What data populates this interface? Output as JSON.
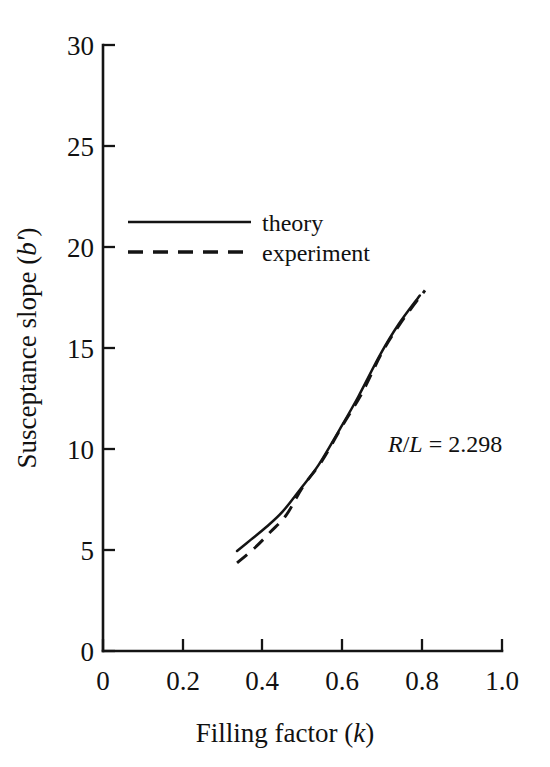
{
  "chart_data": {
    "type": "line",
    "title": "",
    "xlabel": "Filling factor  (k)",
    "xlabel_main": "Filling factor",
    "xlabel_symbol": "k",
    "ylabel": "Susceptance slope (b')",
    "ylabel_main": "Susceptance slope",
    "ylabel_symbol": "b'",
    "xlim": [
      0,
      1.0
    ],
    "ylim": [
      0,
      30
    ],
    "xticks": [
      0,
      0.2,
      0.4,
      0.6,
      0.8,
      1.0
    ],
    "xtick_labels": [
      "0",
      "0.2",
      "0.4",
      "0.6",
      "0.8",
      "1.0"
    ],
    "yticks": [
      0,
      5,
      10,
      15,
      20,
      25,
      30
    ],
    "ytick_labels": [
      "0",
      "5",
      "10",
      "15",
      "20",
      "25",
      "30"
    ],
    "grid": false,
    "legend_position": "upper-left-inside",
    "series": [
      {
        "name": "theory",
        "style": "solid",
        "color": "#141414",
        "x": [
          0.336,
          0.37,
          0.41,
          0.45,
          0.494,
          0.54,
          0.594,
          0.64,
          0.694,
          0.74,
          0.794
        ],
        "y": [
          4.95,
          5.5,
          6.15,
          6.9,
          8.0,
          9.2,
          11.0,
          12.6,
          14.65,
          16.15,
          17.6
        ]
      },
      {
        "name": "experiment",
        "style": "dashed",
        "color": "#141414",
        "x": [
          0.336,
          0.38,
          0.42,
          0.46,
          0.5,
          0.55,
          0.6,
          0.65,
          0.7,
          0.75,
          0.807
        ],
        "y": [
          4.36,
          5.1,
          5.9,
          6.75,
          8.1,
          9.45,
          11.15,
          12.8,
          14.8,
          16.35,
          17.85
        ]
      }
    ],
    "annotations": [
      {
        "name": "ratio-annotation",
        "text": "R/L = 2.298",
        "numerator": "R",
        "slash": "/",
        "denominator": "L",
        "equals": " = ",
        "value": "2.298",
        "x": 0.72,
        "y": 10.2
      }
    ],
    "legend_entries": [
      {
        "label": "theory",
        "style": "solid"
      },
      {
        "label": "experiment",
        "style": "dashed"
      }
    ]
  },
  "figure": {
    "background_color": "#ffffff",
    "ink_color": "#141414"
  }
}
